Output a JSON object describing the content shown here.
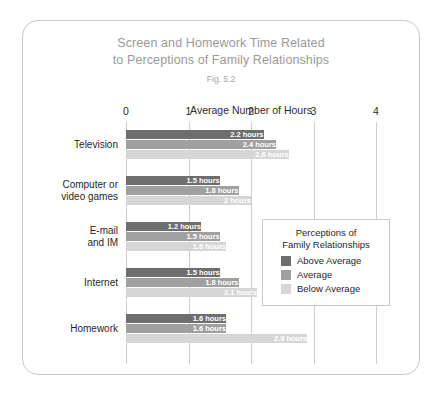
{
  "figure": {
    "title_line_1": "Screen and Homework Time Related",
    "title_line_2": "to Perceptions of Family Relationships",
    "fig_number": "Fig. 5.2"
  },
  "legend": {
    "title_line_1": "Perceptions of",
    "title_line_2": "Family Relationships"
  },
  "colors": {
    "above_average": "#6e6e6e",
    "average": "#a0a0a0",
    "below_average": "#d6d6d6",
    "gridline": "#cfcfcf",
    "title_text": "#9a9a9a",
    "body_text": "#1f1f1f",
    "card_border": "#c9c9c9"
  },
  "chart_data": {
    "type": "bar",
    "orientation": "horizontal",
    "title": "Screen and Homework Time Related to Perceptions of Family Relationships",
    "subtitle": "Fig. 5.2",
    "xlabel": "Average Number of Hours",
    "ylabel": "",
    "xlim": [
      0,
      4
    ],
    "xticks": [
      "0",
      "1",
      "2",
      "3",
      "4"
    ],
    "grid": true,
    "legend_position": "inside-right",
    "categories": [
      "Television",
      "Computer or video games",
      "E-mail and IM",
      "Internet",
      "Homework"
    ],
    "category_label_lines": [
      [
        "Television"
      ],
      [
        "Computer or",
        "video games"
      ],
      [
        "E-mail",
        "and IM"
      ],
      [
        "Internet"
      ],
      [
        "Homework"
      ]
    ],
    "series": [
      {
        "name": "Above Average",
        "color": "#6e6e6e",
        "values": [
          2.2,
          1.5,
          1.2,
          1.5,
          1.6
        ],
        "labels": [
          "2.2 hours",
          "1.5 hours",
          "1.2 hours",
          "1.5 hours",
          "1.6 hours"
        ]
      },
      {
        "name": "Average",
        "color": "#a0a0a0",
        "values": [
          2.4,
          1.8,
          1.5,
          1.8,
          1.6
        ],
        "labels": [
          "2.4 hours",
          "1.8 hours",
          "1.5 hours",
          "1.8 hours",
          "1.6 hours"
        ]
      },
      {
        "name": "Below Average",
        "color": "#d6d6d6",
        "values": [
          2.6,
          2.0,
          1.6,
          2.1,
          2.9
        ],
        "labels": [
          "2.6 hours",
          "2 hours",
          "1.6 hours",
          "2.1 hours",
          "2.9 hours"
        ]
      }
    ]
  }
}
